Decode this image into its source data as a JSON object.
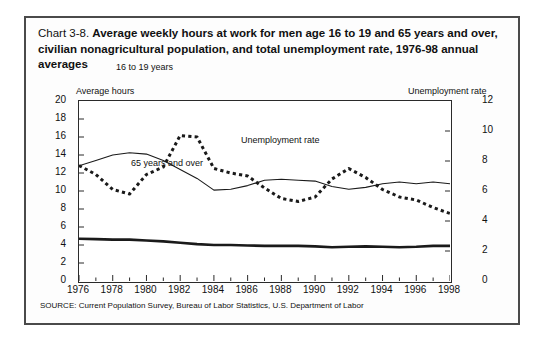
{
  "figure": {
    "title_number": "Chart 3-8.",
    "title_text": "Average weekly hours at work for men age 16 to 19 and 65  years and over, civilian nonagricultural population, and total unemployment rate, 1976-98 annual averages",
    "source_note": "SOURCE: Current Population Survey, Bureau of Labor Statistics, U.S. Department of Labor",
    "left_axis_title": "Average hours",
    "right_axis_title": "Unemployment rate",
    "annotations": {
      "teens": "16 to 19 years",
      "seniors": "65 years and over",
      "unemployment": "Unemployment rate"
    }
  },
  "chart_data": {
    "type": "line",
    "title": "Chart 3-8. Average weekly hours at work for men age 16 to 19 and 65  years and over, civilian nonagricultural population, and total unemployment rate, 1976-98 annual averages",
    "xlabel": "",
    "ylabel": "Average hours",
    "y2label": "Unemployment rate",
    "x": [
      1976,
      1977,
      1978,
      1979,
      1980,
      1981,
      1982,
      1983,
      1984,
      1985,
      1986,
      1987,
      1988,
      1989,
      1990,
      1991,
      1992,
      1993,
      1994,
      1995,
      1996,
      1997,
      1998
    ],
    "xlim": [
      1976,
      1998
    ],
    "xticks": [
      1976,
      1978,
      1980,
      1982,
      1984,
      1986,
      1988,
      1990,
      1992,
      1994,
      1996,
      1998
    ],
    "xtick_labels": [
      "1976",
      "1978",
      "1980",
      "1982",
      "1984",
      "1986",
      "1988",
      "1990",
      "1992",
      "1994",
      "1996",
      "1998"
    ],
    "ylim": [
      0,
      20
    ],
    "yticks": [
      0,
      2,
      4,
      6,
      8,
      10,
      12,
      14,
      16,
      18,
      20
    ],
    "ytick_labels": [
      "0",
      "2",
      "4",
      "6",
      "8",
      "10",
      "12",
      "14",
      "16",
      "18",
      "20"
    ],
    "y2lim": [
      0,
      12
    ],
    "y2ticks": [
      0,
      2,
      4,
      6,
      8,
      10,
      12
    ],
    "y2tick_labels": [
      "0",
      "2",
      "4",
      "6",
      "8",
      "10",
      "12"
    ],
    "grid": false,
    "legend_position": "inline-annotations",
    "series": [
      {
        "name": "16 to 19 years",
        "axis": "left",
        "style": "thin-solid",
        "units": "average weekly hours",
        "values": [
          12.8,
          13.4,
          14.0,
          14.25,
          14.1,
          13.4,
          12.4,
          11.4,
          10.1,
          10.2,
          10.6,
          11.2,
          11.3,
          11.2,
          11.1,
          10.5,
          10.2,
          10.4,
          10.8,
          11.0,
          10.8,
          11.0,
          10.8
        ]
      },
      {
        "name": "65 years and over",
        "axis": "left",
        "style": "thick-solid",
        "units": "average weekly hours",
        "values": [
          4.7,
          4.65,
          4.6,
          4.6,
          4.5,
          4.4,
          4.25,
          4.1,
          4.0,
          4.0,
          3.95,
          3.9,
          3.9,
          3.9,
          3.85,
          3.75,
          3.8,
          3.85,
          3.8,
          3.75,
          3.8,
          3.9,
          3.9
        ]
      },
      {
        "name": "Unemployment rate",
        "axis": "right",
        "style": "dotted",
        "units": "percent",
        "values": [
          7.7,
          7.1,
          6.1,
          5.8,
          7.1,
          7.6,
          9.7,
          9.6,
          7.5,
          7.2,
          7.0,
          6.2,
          5.5,
          5.3,
          5.6,
          6.8,
          7.5,
          6.9,
          6.1,
          5.6,
          5.4,
          4.9,
          4.5
        ]
      }
    ]
  }
}
